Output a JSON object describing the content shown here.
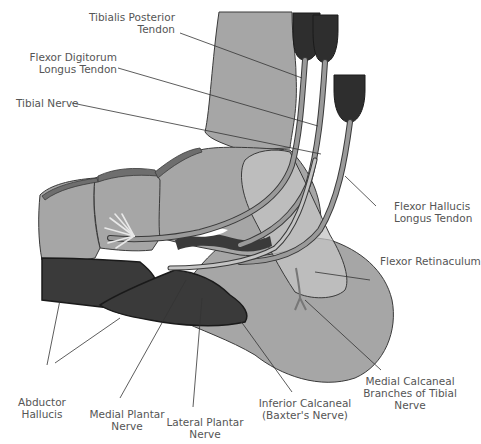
{
  "diagram": {
    "colors": {
      "background": "#ffffff",
      "bone_fill": "#a6a6a6",
      "bone_light_fill": "#bdbdbd",
      "outline": "#3a3a3a",
      "muscle_dark": "#3a3a3a",
      "tendon_fill": "#9a9a9a",
      "nerve_fill": "#c4c4c4",
      "leader_line": "#333333",
      "label_text": "#555555"
    }
  },
  "labels": {
    "tibialis_posterior": {
      "line1": "Tibialis Posterior",
      "line2": "Tendon"
    },
    "flexor_digitorum": {
      "line1": "Flexor Digitorum",
      "line2": "Longus Tendon"
    },
    "tibial_nerve": {
      "line1": "Tibial Nerve"
    },
    "flexor_hallucis": {
      "line1": "Flexor Hallucis",
      "line2": "Longus Tendon"
    },
    "flexor_retinaculum": {
      "line1": "Flexor Retinaculum"
    },
    "abductor_hallucis": {
      "line1": "Abductor",
      "line2": "Hallucis"
    },
    "medial_plantar": {
      "line1": "Medial Plantar",
      "line2": "Nerve"
    },
    "lateral_plantar": {
      "line1": "Lateral Plantar",
      "line2": "Nerve"
    },
    "inferior_calcaneal": {
      "line1": "Inferior Calcaneal",
      "line2": "(Baxter's Nerve)"
    },
    "medial_calcaneal": {
      "line1": "Medial Calcaneal",
      "line2": "Branches of Tibial",
      "line3": "Nerve"
    }
  }
}
